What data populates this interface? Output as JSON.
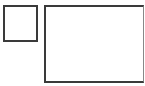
{
  "diagram": {
    "shapes": [
      {
        "id": "small-box",
        "type": "rectangle",
        "label": "",
        "border_color": "#3a3a3a",
        "fill": "#ffffff"
      },
      {
        "id": "large-box",
        "type": "rectangle",
        "label": "",
        "border_color": "#3a3a3a",
        "fill": "#ffffff"
      }
    ]
  }
}
